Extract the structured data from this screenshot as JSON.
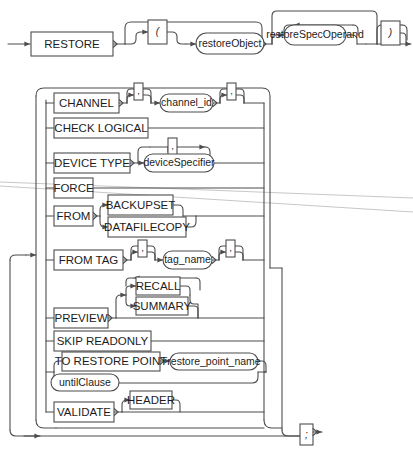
{
  "diagram": {
    "kind": "railroad-syntax-diagram",
    "name": "RESTORE",
    "start_arrow": "→",
    "colors": {
      "line": "#4d4d4d",
      "text": "#1c1c1c",
      "background": "#ffffff",
      "artifact": "#b9b9b9"
    },
    "header": {
      "keyword": "RESTORE",
      "open_paren": "(",
      "close_paren": ")",
      "restore_object": "restoreObject",
      "restore_spec_operand": "restoreSpecOperand"
    },
    "comma": ",",
    "terminator": ";",
    "options": [
      {
        "id": "channel",
        "keyword": "CHANNEL",
        "argument": "channel_id",
        "argument_type": "nonterminal",
        "leading_comma": ",",
        "trailing_comma": ","
      },
      {
        "id": "check-logical",
        "keyword": "CHECK LOGICAL",
        "argument": null,
        "argument_type": null
      },
      {
        "id": "device-type",
        "keyword": "DEVICE TYPE",
        "argument": "deviceSpecifier",
        "argument_type": "nonterminal",
        "repeat_comma": ","
      },
      {
        "id": "force",
        "keyword": "FORCE",
        "argument": null,
        "argument_type": null
      },
      {
        "id": "from",
        "keyword": "FROM",
        "argument": null,
        "argument_type": null,
        "choices": [
          "BACKUPSET",
          "DATAFILECOPY"
        ]
      },
      {
        "id": "from-tag",
        "keyword": "FROM TAG",
        "argument": "tag_name",
        "argument_type": "nonterminal",
        "leading_comma": ",",
        "trailing_comma": ","
      },
      {
        "id": "preview",
        "keyword": "PREVIEW",
        "argument": null,
        "argument_type": null,
        "choices": [
          "RECALL",
          "SUMMARY"
        ]
      },
      {
        "id": "skip-readonly",
        "keyword": "SKIP READONLY",
        "argument": null,
        "argument_type": null
      },
      {
        "id": "to-restore-point",
        "keyword": "TO RESTORE POINT",
        "argument": "restore_point_name",
        "argument_type": "nonterminal"
      },
      {
        "id": "until-clause",
        "keyword": "untilClause",
        "keyword_type": "nonterminal",
        "argument": null,
        "argument_type": null
      },
      {
        "id": "validate",
        "keyword": "VALIDATE",
        "argument": "HEADER",
        "argument_type": "terminal"
      }
    ]
  }
}
